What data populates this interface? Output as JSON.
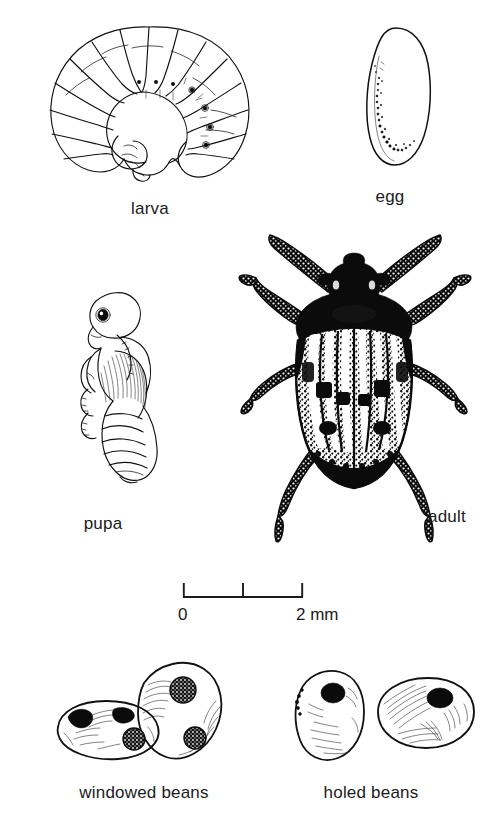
{
  "plate": {
    "title": "Bean weevil life cycle and bean damage plate",
    "background_color": "#ffffff",
    "ink_color": "#111111"
  },
  "figures": [
    {
      "id": "larva",
      "label": "larva",
      "label_x": 150,
      "label_y": 200,
      "description": "C-shaped white grub with segmented radial body folds and small spiracle dots"
    },
    {
      "id": "egg",
      "label": "egg",
      "label_x": 390,
      "label_y": 188,
      "description": "Elongated oval egg outline with stippled shading along lower left margin"
    },
    {
      "id": "pupa",
      "label": "pupa",
      "label_x": 103,
      "label_y": 515,
      "description": "Lateral view pupa with visible eye, folded legs, striated wing pads and segmented abdomen"
    },
    {
      "id": "adult",
      "label": "adult",
      "label_x": 428,
      "label_y": 515,
      "description": "Dorsal view of adult bruchid beetle, dark pronotum and head, mottled striped elytra, six legs and two antennae"
    },
    {
      "id": "windowed-beans",
      "label": "windowed beans",
      "label_x": 144,
      "label_y": 786,
      "description": "Two beans drawn with dark stippled circular windows where larvae have fed beneath the seed coat"
    },
    {
      "id": "holed-beans",
      "label": "holed beans",
      "label_x": 371,
      "label_y": 786,
      "description": "Two beans drawn with solid black round exit holes made by emerged adults"
    }
  ],
  "scale_bar": {
    "name": "scale-bar",
    "start_label": "0",
    "end_label": "2 mm",
    "ticks": [
      "0",
      "1",
      "2"
    ],
    "tick_count": 3,
    "span_mm": 2,
    "x_start": 183,
    "x_end": 303,
    "y": 597,
    "start_label_x": 180,
    "end_label_x": 297,
    "label_y": 606
  }
}
